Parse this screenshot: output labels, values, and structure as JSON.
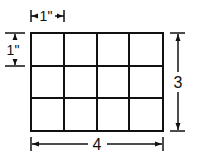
{
  "diagram": {
    "title": "",
    "grid": {
      "columns": 4,
      "rows": 3
    },
    "dimensions": {
      "cell_width_label": "1\"",
      "cell_height_label": "1\"",
      "total_height_label": "3",
      "total_width_label": "4"
    },
    "colors": {
      "line": "#111111",
      "background": "#ffffff"
    }
  }
}
